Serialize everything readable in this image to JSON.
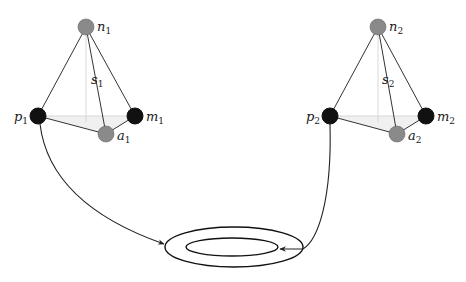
{
  "diagram": {
    "type": "two tetrahedra connected to a ring (annulus)",
    "tetrahedra": [
      {
        "id": "1",
        "nodes": {
          "n": {
            "label": "n",
            "sub": "1",
            "color": "gray"
          },
          "p": {
            "label": "p",
            "sub": "1",
            "color": "black"
          },
          "m": {
            "label": "m",
            "sub": "1",
            "color": "black"
          },
          "a": {
            "label": "a",
            "sub": "1",
            "color": "gray"
          }
        },
        "edge_label": {
          "label": "s",
          "sub": "1"
        }
      },
      {
        "id": "2",
        "nodes": {
          "n": {
            "label": "n",
            "sub": "2",
            "color": "gray"
          },
          "p": {
            "label": "p",
            "sub": "2",
            "color": "black"
          },
          "m": {
            "label": "m",
            "sub": "2",
            "color": "black"
          },
          "a": {
            "label": "a",
            "sub": "2",
            "color": "gray"
          }
        },
        "edge_label": {
          "label": "s",
          "sub": "2"
        }
      }
    ],
    "ring": {
      "description": "two concentric ellipses (annulus)"
    },
    "arrows": [
      {
        "from": "p1",
        "to": "outer ring (left side)"
      },
      {
        "from": "p2",
        "to": "inner ring (right side)"
      }
    ],
    "colors": {
      "dark_node": "#111111",
      "gray_node": "#8a8a8a",
      "edge": "#333333"
    }
  }
}
